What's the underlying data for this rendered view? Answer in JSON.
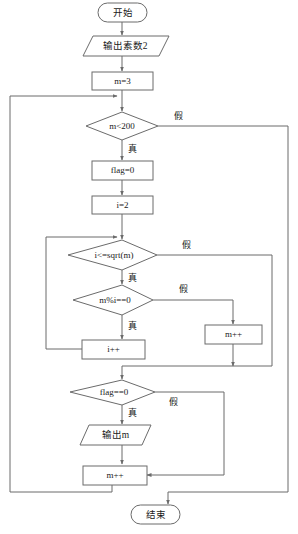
{
  "diagram": {
    "stroke_color": "#6b6b6b",
    "text_color": "#1a1a1a",
    "background_color": "#ffffff",
    "nodes": {
      "start": {
        "label": "开始",
        "shape": "terminator"
      },
      "output_prime_2": {
        "label": "输出素数2",
        "shape": "parallelogram"
      },
      "init_m": {
        "label": "m=3",
        "shape": "process"
      },
      "cond_m_lt_200": {
        "label": "m<200",
        "shape": "decision"
      },
      "flag_zero": {
        "label": "flag=0",
        "shape": "process"
      },
      "init_i": {
        "label": "i=2",
        "shape": "process"
      },
      "cond_i_le_sqrt": {
        "label": "i<=sqrt(m)",
        "shape": "decision"
      },
      "cond_mod": {
        "label": "m%i==0",
        "shape": "decision"
      },
      "inc_i": {
        "label": "i++",
        "shape": "process"
      },
      "inc_m_inner": {
        "label": "m++",
        "shape": "process"
      },
      "cond_flag": {
        "label": "flag==0",
        "shape": "decision"
      },
      "output_m": {
        "label": "输出m",
        "shape": "parallelogram"
      },
      "inc_m_outer": {
        "label": "m++",
        "shape": "process"
      },
      "end": {
        "label": "结束",
        "shape": "terminator"
      }
    },
    "edge_labels": {
      "m_lt_200_false": "假",
      "m_lt_200_true": "真",
      "i_le_sqrt_false": "假",
      "i_le_sqrt_true": "真",
      "mod_false": "假",
      "mod_true": "真",
      "flag_false": "假",
      "flag_true": "真"
    }
  }
}
